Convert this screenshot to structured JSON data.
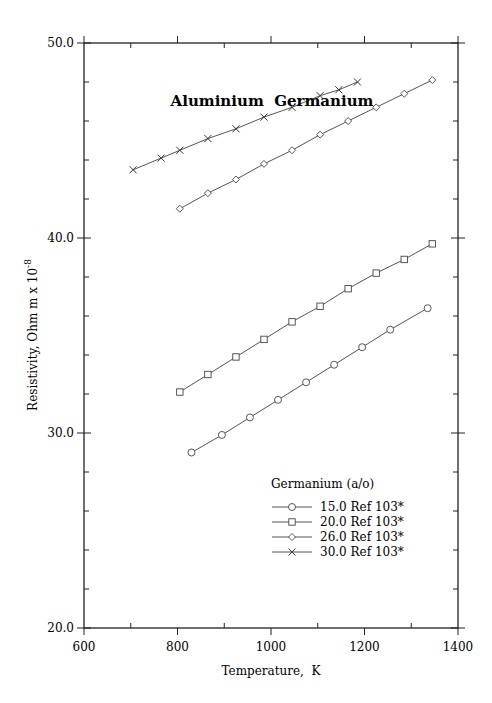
{
  "chart_data": {
    "type": "line",
    "title": "Aluminium  Germanium",
    "xlabel": "Temperature,  K",
    "ylabel": "Resistivity, Ohm m x 10",
    "ylabel_exp": "-8",
    "xlim": [
      600,
      1400
    ],
    "ylim": [
      20.0,
      50.0
    ],
    "xticks": [
      "600",
      "800",
      "1000",
      "1200",
      "1400"
    ],
    "yticks": [
      "20.0",
      "30.0",
      "40.0",
      "50.0"
    ],
    "grid": false,
    "legend_title": "Germanium (a/o)",
    "legend_position": "lower right",
    "series": [
      {
        "name": "15.0 Ref 103*",
        "marker": "circle",
        "x": [
          830,
          895,
          955,
          1015,
          1075,
          1135,
          1195,
          1255,
          1335
        ],
        "y": [
          29.0,
          29.9,
          30.8,
          31.7,
          32.6,
          33.5,
          34.4,
          35.3,
          36.4
        ]
      },
      {
        "name": "20.0 Ref 103*",
        "marker": "square",
        "x": [
          805,
          865,
          925,
          985,
          1045,
          1105,
          1165,
          1225,
          1285,
          1345
        ],
        "y": [
          32.1,
          33.0,
          33.9,
          34.8,
          35.7,
          36.5,
          37.4,
          38.2,
          38.9,
          39.7
        ]
      },
      {
        "name": "26.0 Ref 103*",
        "marker": "diamond",
        "x": [
          805,
          865,
          925,
          985,
          1045,
          1105,
          1165,
          1225,
          1285,
          1345
        ],
        "y": [
          41.5,
          42.3,
          43.0,
          43.8,
          44.5,
          45.3,
          46.0,
          46.7,
          47.4,
          48.1
        ]
      },
      {
        "name": "30.0 Ref 103*",
        "marker": "cross",
        "x": [
          705,
          765,
          805,
          865,
          925,
          985,
          1045,
          1105,
          1145,
          1185
        ],
        "y": [
          43.5,
          44.1,
          44.5,
          45.1,
          45.6,
          46.2,
          46.7,
          47.3,
          47.6,
          48.0
        ]
      }
    ]
  }
}
